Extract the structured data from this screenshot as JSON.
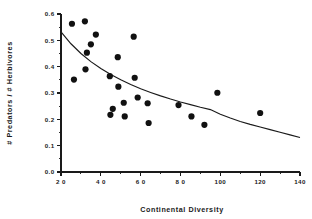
{
  "chart_data": {
    "type": "scatter",
    "title": "",
    "xlabel": "Continental  Diversity",
    "ylabel": "# Predators / # Herbivores",
    "xlim": [
      20,
      140
    ],
    "ylim": [
      0.0,
      0.6
    ],
    "grid": false,
    "legend": null,
    "xticks": [
      20,
      40,
      60,
      80,
      100,
      120,
      140
    ],
    "xtick_labels": [
      "2 0",
      "4 0",
      "6 0",
      "8 0",
      "100",
      "120",
      "140"
    ],
    "xminor_step": 10,
    "yticks": [
      0.0,
      0.1,
      0.2,
      0.3,
      0.4,
      0.5,
      0.6
    ],
    "ytick_labels": [
      "0.0",
      "0.1",
      "0.2",
      "0.3",
      "0.4",
      "0.5",
      "0.6"
    ],
    "yminor_step": 0.05,
    "marker": "filled-circle",
    "marker_color": "#111111",
    "marker_size": 3.1,
    "points": [
      {
        "x": 25.5,
        "y": 0.563
      },
      {
        "x": 26.5,
        "y": 0.351
      },
      {
        "x": 32.0,
        "y": 0.572
      },
      {
        "x": 32.3,
        "y": 0.39
      },
      {
        "x": 33.0,
        "y": 0.453
      },
      {
        "x": 35.0,
        "y": 0.485
      },
      {
        "x": 37.5,
        "y": 0.522
      },
      {
        "x": 44.5,
        "y": 0.364
      },
      {
        "x": 44.8,
        "y": 0.217
      },
      {
        "x": 46.0,
        "y": 0.24
      },
      {
        "x": 48.5,
        "y": 0.436
      },
      {
        "x": 48.8,
        "y": 0.324
      },
      {
        "x": 51.5,
        "y": 0.263
      },
      {
        "x": 52.0,
        "y": 0.211
      },
      {
        "x": 56.5,
        "y": 0.514
      },
      {
        "x": 57.0,
        "y": 0.358
      },
      {
        "x": 58.5,
        "y": 0.283
      },
      {
        "x": 63.5,
        "y": 0.261
      },
      {
        "x": 64.0,
        "y": 0.186
      },
      {
        "x": 79.0,
        "y": 0.254
      },
      {
        "x": 85.5,
        "y": 0.211
      },
      {
        "x": 92.0,
        "y": 0.179
      },
      {
        "x": 98.5,
        "y": 0.301
      },
      {
        "x": 120.0,
        "y": 0.224
      }
    ],
    "fit_curve": {
      "kind": "power-decay",
      "description": "decreasing fitted curve from (20, 0.532) to (140, 0.131)",
      "points": [
        {
          "x": 20,
          "y": 0.532
        },
        {
          "x": 25,
          "y": 0.487
        },
        {
          "x": 30,
          "y": 0.45
        },
        {
          "x": 35,
          "y": 0.419
        },
        {
          "x": 40,
          "y": 0.393
        },
        {
          "x": 45,
          "y": 0.37
        },
        {
          "x": 50,
          "y": 0.35
        },
        {
          "x": 55,
          "y": 0.332
        },
        {
          "x": 60,
          "y": 0.316
        },
        {
          "x": 65,
          "y": 0.302
        },
        {
          "x": 70,
          "y": 0.289
        },
        {
          "x": 75,
          "y": 0.277
        },
        {
          "x": 80,
          "y": 0.266
        },
        {
          "x": 85,
          "y": 0.256
        },
        {
          "x": 90,
          "y": 0.246
        },
        {
          "x": 95,
          "y": 0.237
        },
        {
          "x": 100,
          "y": 0.219
        },
        {
          "x": 105,
          "y": 0.205
        },
        {
          "x": 110,
          "y": 0.192
        },
        {
          "x": 115,
          "y": 0.181
        },
        {
          "x": 120,
          "y": 0.171
        },
        {
          "x": 125,
          "y": 0.161
        },
        {
          "x": 130,
          "y": 0.151
        },
        {
          "x": 135,
          "y": 0.141
        },
        {
          "x": 140,
          "y": 0.131
        }
      ]
    }
  },
  "figure": {
    "background_color": "#ffffff",
    "foreground_color": "#1a1a1a"
  }
}
